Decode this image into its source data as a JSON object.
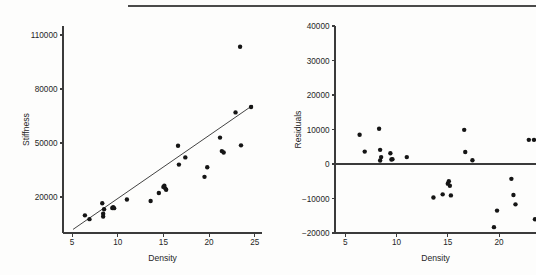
{
  "figure": {
    "background_color": "#fdfdfc",
    "foreground_color": "#262626",
    "rule_color": "#4a4a4a",
    "point_color": "#151515",
    "panel_count": 2
  },
  "chart_data": [
    {
      "type": "scatter",
      "id": "stiffness-vs-density",
      "title": "",
      "xlabel": "Density",
      "ylabel": "Stiffness",
      "xlim": [
        4.0,
        25.8
      ],
      "ylim": [
        0,
        115000
      ],
      "xticks": [
        5,
        10,
        15,
        20,
        25
      ],
      "xticklabels": [
        "5",
        "10",
        "15",
        "20",
        "25"
      ],
      "yticks": [
        20000,
        50000,
        80000,
        110000
      ],
      "yticklabels": [
        "20000",
        "50000",
        "80000",
        "110000"
      ],
      "grid": false,
      "legend": false,
      "x": [
        6.4,
        6.9,
        8.3,
        8.4,
        8.4,
        8.5,
        9.4,
        9.5,
        9.6,
        11.0,
        13.6,
        14.5,
        15.0,
        15.1,
        15.2,
        15.3,
        16.6,
        16.7,
        17.4,
        19.5,
        19.8,
        21.2,
        21.4,
        21.6,
        22.9,
        23.4,
        23.5,
        24.6
      ],
      "y": [
        9800,
        7700,
        16500,
        10700,
        9200,
        13200,
        13900,
        14300,
        13800,
        18600,
        17800,
        22200,
        25600,
        26300,
        24800,
        24000,
        48500,
        38000,
        42000,
        31200,
        36500,
        53000,
        45500,
        44700,
        67000,
        103500,
        48700,
        70000
      ],
      "fit_line": {
        "x": [
          5.1,
          24.8
        ],
        "y": [
          2000,
          71000
        ],
        "label": "least-squares fit"
      },
      "series": [
        {
          "name": "observations",
          "marker": "filled-circle",
          "size": 2.2
        }
      ]
    },
    {
      "type": "scatter",
      "id": "residuals-vs-density",
      "title": "",
      "xlabel": "Density",
      "ylabel": "Residuals",
      "xlim": [
        4.0,
        23.6
      ],
      "ylim": [
        -20000,
        40000
      ],
      "xticks": [
        5,
        10,
        15,
        20
      ],
      "xticklabels": [
        "5",
        "10",
        "15",
        "20"
      ],
      "yticks": [
        -20000,
        -10000,
        0,
        10000,
        20000,
        30000,
        40000
      ],
      "yticklabels": [
        "-20000",
        "-10000",
        "0",
        "10000",
        "20000",
        "30000",
        "40000"
      ],
      "grid": false,
      "legend": false,
      "zero_reference_line": 0,
      "x": [
        6.4,
        6.9,
        8.3,
        8.4,
        8.4,
        8.5,
        9.4,
        9.5,
        9.6,
        11.0,
        13.6,
        14.5,
        15.0,
        15.1,
        15.2,
        15.3,
        16.6,
        16.7,
        17.4,
        19.5,
        19.8,
        21.2,
        21.4,
        21.6,
        22.9,
        23.4,
        23.5
      ],
      "y": [
        8500,
        3600,
        10200,
        4100,
        1000,
        2000,
        3100,
        1300,
        1400,
        2000,
        -9700,
        -8800,
        -5700,
        -5000,
        -6300,
        -9100,
        9900,
        3500,
        1100,
        -18300,
        -13500,
        -4300,
        -9000,
        -11700,
        7000,
        7000,
        -16000
      ],
      "series": [
        {
          "name": "residuals",
          "marker": "filled-circle",
          "size": 2.2
        }
      ]
    }
  ],
  "panels": {
    "left": {
      "name": "stiffness-scatter-panel",
      "ylabel": "Stiffness",
      "xlabel": "Density"
    },
    "right": {
      "name": "residual-scatter-panel",
      "ylabel": "Residuals",
      "xlabel": "Density"
    }
  }
}
